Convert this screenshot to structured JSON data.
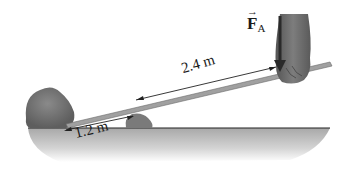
{
  "diagram": {
    "labels": {
      "force": "F",
      "force_subscript": "A",
      "force_arrow": "→",
      "long_arm": "2.4 m",
      "short_arm": "1.2 m"
    },
    "elements": [
      "ground",
      "rock",
      "fulcrum-stone",
      "lever-bar",
      "hand",
      "force-arrow",
      "dimension-2.4m",
      "dimension-1.2m"
    ],
    "colors": {
      "ground": "#b8b8b8",
      "rock": "#7a7a7a",
      "bar": "#9a9a9a",
      "hand": "#6e6e6e",
      "ink": "#1a1a1a"
    }
  }
}
